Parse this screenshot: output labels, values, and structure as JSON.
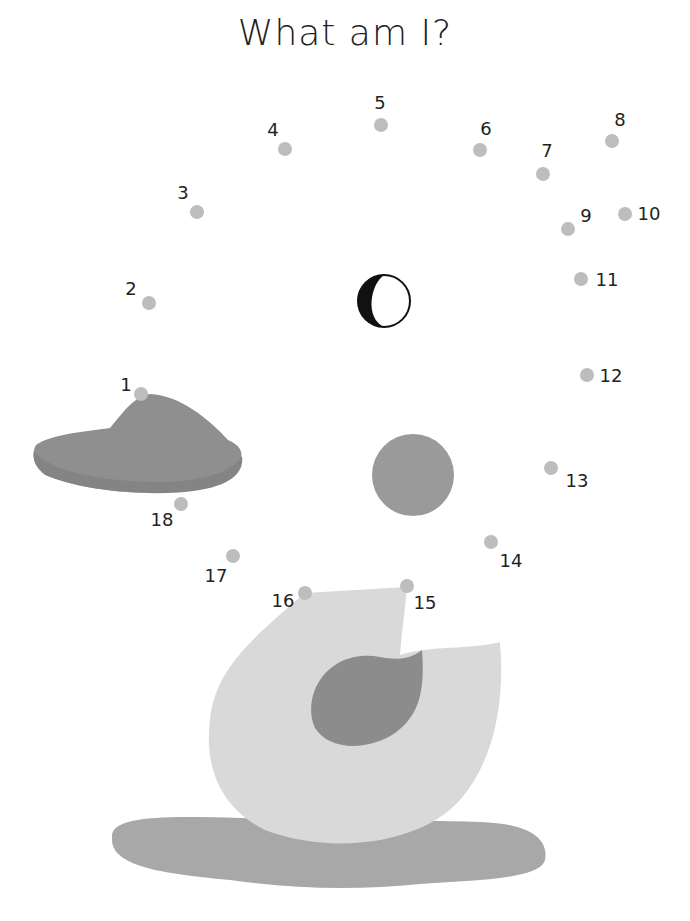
{
  "title": "What am I?",
  "colors": {
    "dot": "#bdbdbd",
    "body": "#d9d9d9",
    "wing": "#8c8c8c",
    "beak": "#8f8f8f",
    "cheek": "#9a9a9a",
    "shadow": "#a8a8a8",
    "text": "#222222"
  },
  "dots": [
    {
      "n": "1",
      "x": 141,
      "y": 394,
      "lx": 126,
      "ly": 385
    },
    {
      "n": "2",
      "x": 149,
      "y": 303,
      "lx": 131,
      "ly": 289
    },
    {
      "n": "3",
      "x": 197,
      "y": 212,
      "lx": 183,
      "ly": 193
    },
    {
      "n": "4",
      "x": 285,
      "y": 149,
      "lx": 273,
      "ly": 130
    },
    {
      "n": "5",
      "x": 381,
      "y": 125,
      "lx": 380,
      "ly": 103
    },
    {
      "n": "6",
      "x": 480,
      "y": 150,
      "lx": 486,
      "ly": 129
    },
    {
      "n": "7",
      "x": 543,
      "y": 174,
      "lx": 547,
      "ly": 151
    },
    {
      "n": "8",
      "x": 612,
      "y": 141,
      "lx": 620,
      "ly": 120
    },
    {
      "n": "9",
      "x": 568,
      "y": 229,
      "lx": 586,
      "ly": 216
    },
    {
      "n": "10",
      "x": 625,
      "y": 214,
      "lx": 649,
      "ly": 214
    },
    {
      "n": "11",
      "x": 581,
      "y": 279,
      "lx": 607,
      "ly": 280
    },
    {
      "n": "12",
      "x": 587,
      "y": 375,
      "lx": 611,
      "ly": 376
    },
    {
      "n": "13",
      "x": 551,
      "y": 468,
      "lx": 577,
      "ly": 481
    },
    {
      "n": "14",
      "x": 491,
      "y": 542,
      "lx": 511,
      "ly": 561
    },
    {
      "n": "15",
      "x": 407,
      "y": 586,
      "lx": 425,
      "ly": 603
    },
    {
      "n": "16",
      "x": 305,
      "y": 593,
      "lx": 283,
      "ly": 601
    },
    {
      "n": "17",
      "x": 233,
      "y": 556,
      "lx": 216,
      "ly": 576
    },
    {
      "n": "18",
      "x": 181,
      "y": 504,
      "lx": 162,
      "ly": 520
    }
  ]
}
